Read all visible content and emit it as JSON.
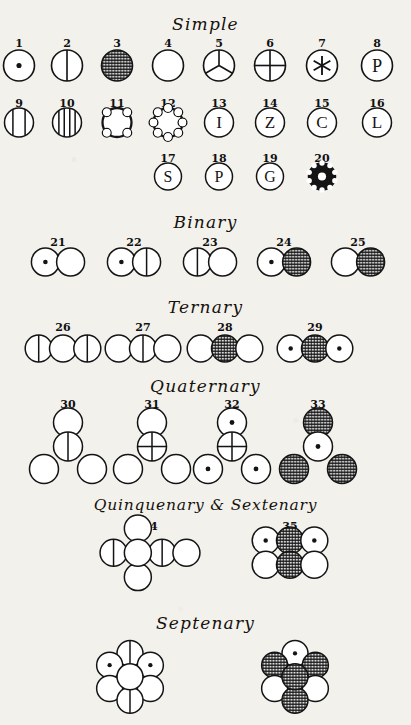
{
  "plate": {
    "title": "Dalton atomic symbols plate",
    "background_color": "#f3f1ec",
    "ink_color": "#141414"
  },
  "sections": [
    {
      "id": "simple",
      "label": "Simple"
    },
    {
      "id": "binary",
      "label": "Binary"
    },
    {
      "id": "ternary",
      "label": "Ternary"
    },
    {
      "id": "quaternary",
      "label": "Quaternary"
    },
    {
      "id": "quinquenary",
      "label": "Quinquenary & Sextenary"
    },
    {
      "id": "septenary",
      "label": "Septenary"
    }
  ],
  "symbols": [
    {
      "num": "1",
      "section": "simple",
      "glyph": "circle-dot"
    },
    {
      "num": "2",
      "section": "simple",
      "glyph": "circle-vline"
    },
    {
      "num": "3",
      "section": "simple",
      "glyph": "circle-hatched"
    },
    {
      "num": "4",
      "section": "simple",
      "glyph": "circle-plain"
    },
    {
      "num": "5",
      "section": "simple",
      "glyph": "circle-trispoke"
    },
    {
      "num": "6",
      "section": "simple",
      "glyph": "circle-cross"
    },
    {
      "num": "7",
      "section": "simple",
      "glyph": "circle-asterisk"
    },
    {
      "num": "8",
      "section": "simple",
      "glyph": "circle-letter",
      "letter": "P"
    },
    {
      "num": "9",
      "section": "simple",
      "glyph": "circle-stripes-2"
    },
    {
      "num": "10",
      "section": "simple",
      "glyph": "circle-stripes-3"
    },
    {
      "num": "11",
      "section": "simple",
      "glyph": "circle-notched-4"
    },
    {
      "num": "12",
      "section": "simple",
      "glyph": "circle-notched-8"
    },
    {
      "num": "13",
      "section": "simple",
      "glyph": "circle-letter",
      "letter": "I"
    },
    {
      "num": "14",
      "section": "simple",
      "glyph": "circle-letter",
      "letter": "Z"
    },
    {
      "num": "15",
      "section": "simple",
      "glyph": "circle-letter",
      "letter": "C"
    },
    {
      "num": "16",
      "section": "simple",
      "glyph": "circle-letter",
      "letter": "L"
    },
    {
      "num": "17",
      "section": "simple",
      "glyph": "circle-letter",
      "letter": "S"
    },
    {
      "num": "18",
      "section": "simple",
      "glyph": "circle-letter",
      "letter": "P"
    },
    {
      "num": "19",
      "section": "simple",
      "glyph": "circle-letter",
      "letter": "G"
    },
    {
      "num": "20",
      "section": "simple",
      "glyph": "circle-gear-dark"
    },
    {
      "num": "21",
      "section": "binary",
      "glyph": "cluster",
      "parts": [
        "dot",
        "plain"
      ]
    },
    {
      "num": "22",
      "section": "binary",
      "glyph": "cluster",
      "parts": [
        "dot",
        "vline"
      ]
    },
    {
      "num": "23",
      "section": "binary",
      "glyph": "cluster",
      "parts": [
        "vline",
        "plain"
      ]
    },
    {
      "num": "24",
      "section": "binary",
      "glyph": "cluster",
      "parts": [
        "dot",
        "hatched"
      ]
    },
    {
      "num": "25",
      "section": "binary",
      "glyph": "cluster",
      "parts": [
        "plain",
        "hatched"
      ]
    },
    {
      "num": "26",
      "section": "ternary",
      "glyph": "cluster",
      "parts": [
        "vline",
        "plain",
        "vline"
      ]
    },
    {
      "num": "27",
      "section": "ternary",
      "glyph": "cluster",
      "parts": [
        "plain",
        "vline",
        "plain"
      ]
    },
    {
      "num": "28",
      "section": "ternary",
      "glyph": "cluster",
      "parts": [
        "plain",
        "hatched",
        "plain"
      ]
    },
    {
      "num": "29",
      "section": "ternary",
      "glyph": "cluster",
      "parts": [
        "dot",
        "hatched",
        "dot"
      ]
    },
    {
      "num": "30",
      "section": "quaternary",
      "glyph": "tetra",
      "parts": [
        "plain",
        "vline",
        "plain",
        "plain"
      ]
    },
    {
      "num": "31",
      "section": "quaternary",
      "glyph": "tetra",
      "parts": [
        "plain",
        "cross",
        "plain",
        "plain"
      ]
    },
    {
      "num": "32",
      "section": "quaternary",
      "glyph": "tetra",
      "parts": [
        "dot",
        "cross",
        "dot",
        "dot"
      ]
    },
    {
      "num": "33",
      "section": "quaternary",
      "glyph": "tetra",
      "parts": [
        "hatched",
        "dot",
        "hatched",
        "hatched"
      ]
    },
    {
      "num": "34",
      "section": "quinquenary",
      "glyph": "penta",
      "parts": [
        "plain",
        "plain",
        "vline",
        "vline",
        "plain"
      ]
    },
    {
      "num": "35",
      "section": "quinquenary",
      "glyph": "sexta",
      "parts": [
        "dot",
        "hatched",
        "dot",
        "plain",
        "hatched",
        "plain"
      ]
    },
    {
      "num": "36",
      "section": "septenary",
      "glyph": "hepta",
      "parts": [
        "plain",
        "vline",
        "dot",
        "dot",
        "plain",
        "plain",
        "vline"
      ]
    },
    {
      "num": "37",
      "section": "septenary",
      "glyph": "hepta",
      "parts": [
        "hatched",
        "dot",
        "hatched",
        "hatched",
        "plain",
        "plain",
        "hatched"
      ]
    }
  ]
}
